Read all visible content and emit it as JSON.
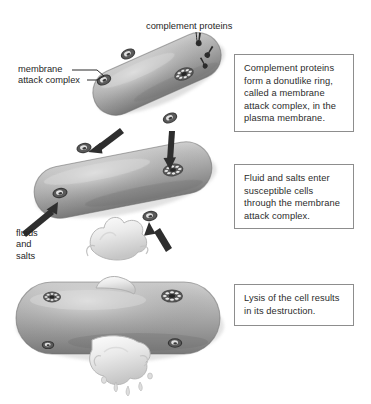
{
  "figure": {
    "background_color": "#ffffff",
    "cell_color": "#a3a3a3",
    "cell_color_light": "#cfcfcf",
    "cell_color_dark": "#6f6f6f",
    "pore_color": "#3a3a3a",
    "arrow_color": "#2e2e2e",
    "fluid_color": "#efefef",
    "box_border_color": "#8d8d8d",
    "text_color": "#2b2b2b"
  },
  "labels": {
    "complement_proteins": "complement proteins",
    "membrane_attack_complex": "membrane\nattack complex",
    "fluids_and_salts": "fluids\nand\nsalts"
  },
  "captions": [
    {
      "id": "box-1",
      "text": "Complement proteins form a donutlike ring, called a membrane attack complex, in the plasma membrane."
    },
    {
      "id": "box-2",
      "text": "Fluid and salts enter susceptible cells through the membrane attack complex."
    },
    {
      "id": "box-3",
      "text": "Lysis of the cell results in its destruction."
    }
  ],
  "stages": [
    {
      "name": "stage-1-pore-formation",
      "description": "Rod-shaped cell with complement proteins assembling into donutlike rings in the plasma membrane",
      "pore_count": 4,
      "rotation_deg": -24
    },
    {
      "name": "stage-2-influx",
      "description": "Rod-shaped cell with arrows showing fluid and salts entering through membrane attack complexes",
      "pore_count": 4,
      "arrow_count": 4,
      "rotation_deg": -11
    },
    {
      "name": "stage-3-lysis",
      "description": "Swollen cell bursting, cytoplasm erupting from top and bottom",
      "pore_count": 4,
      "rotation_deg": 0
    }
  ]
}
